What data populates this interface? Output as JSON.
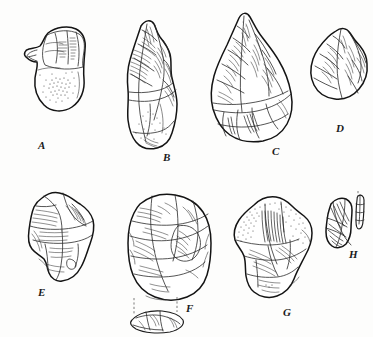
{
  "plate": {
    "kind": "archaeological-illustration-plate",
    "medium": "pen-and-ink line drawing",
    "background_color": "#fdfdfc",
    "ink_color": "#1c1c1c",
    "subject": "chipped stone tools (bifaces, cores, flakes)",
    "specimen_count": 8,
    "rows": 2,
    "columns": 4
  },
  "labels": {
    "a": "A",
    "b": "B",
    "c": "C",
    "d": "D",
    "e": "E",
    "f": "F",
    "g": "G",
    "h": "H"
  },
  "specimens": [
    {
      "label": "A",
      "row": 1,
      "column": 1,
      "form": "core-chopper",
      "outline_shape": "irregular rounded pear",
      "surface_treatment": "stippled cortex on lower body, flake scars on upper platform",
      "approx_width_px": 62,
      "approx_height_px": 105
    },
    {
      "label": "B",
      "row": 1,
      "column": 2,
      "form": "elongated pointed handaxe",
      "outline_shape": "narrow lanceolate with blunt butt",
      "surface_treatment": "long parallel flake-scar hatching, light stipple at base",
      "approx_width_px": 52,
      "approx_height_px": 150
    },
    {
      "label": "C",
      "row": 1,
      "column": 3,
      "form": "triangular handaxe",
      "outline_shape": "teardrop / sub-triangular with rounded base",
      "surface_treatment": "dense invasive flake scars with ripple hatching",
      "approx_width_px": 70,
      "approx_height_px": 140
    },
    {
      "label": "D",
      "row": 1,
      "column": 4,
      "form": "small ovate biface",
      "outline_shape": "pointed oval",
      "surface_treatment": "short flake scars with fine hatching",
      "approx_width_px": 52,
      "approx_height_px": 80
    },
    {
      "label": "E",
      "row": 2,
      "column": 1,
      "form": "angular flake scraper",
      "outline_shape": "irregular wedge with notched lower edge",
      "surface_treatment": "broad facets with horizontal hatching",
      "approx_width_px": 64,
      "approx_height_px": 100
    },
    {
      "label": "F",
      "row": 2,
      "column": 2,
      "form": "prepared (Levallois) core",
      "outline_shape": "broad rounded ovate",
      "surface_treatment": "radial flake scars; dashed tie-lines to lens-shaped cross-section below",
      "has_cross_section": true,
      "cross_section_shape": "plano-convex lens",
      "approx_width_px": 78,
      "approx_height_px": 118
    },
    {
      "label": "G",
      "row": 2,
      "column": 3,
      "form": "cortical flake / side scraper",
      "outline_shape": "irregular sub-rectangular",
      "surface_treatment": "stippled cortex upper zone, dark parallel hatching on flake face",
      "approx_width_px": 64,
      "approx_height_px": 112
    },
    {
      "label": "H",
      "row": 2,
      "column": 4,
      "form": "small flake",
      "outline_shape": "short blocky flake",
      "surface_treatment": "radiating hatching; narrow profile view at right",
      "has_profile_view": true,
      "approx_width_px": 42,
      "approx_height_px": 62
    }
  ]
}
